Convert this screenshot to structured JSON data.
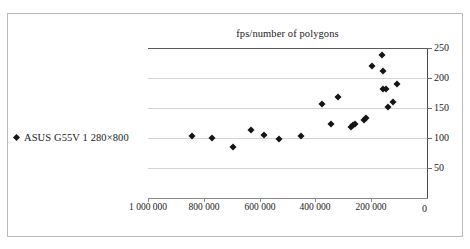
{
  "figure": {
    "background_color": "#ffffff",
    "frame_color": "#b9b9b9",
    "marker_color": "#151515",
    "gridline_color": "#d4d4d4",
    "axis_color": "#4a4a4a"
  },
  "legend": {
    "marker_icon": "diamond-marker-icon",
    "label": "ASUS G55V 1 280×800"
  },
  "chart_data": {
    "type": "scatter",
    "title": "fps/number of polygons",
    "xlabel": "",
    "ylabel": "",
    "xlim": [
      1000000,
      0
    ],
    "ylim": [
      0,
      250
    ],
    "x_reversed": true,
    "grid": true,
    "legend_position": "left",
    "xticks": [
      1000000,
      800000,
      600000,
      400000,
      200000,
      0
    ],
    "xticklabels": [
      "1 000 000",
      "800 000",
      "600 000",
      "400 000",
      "200 000",
      "0"
    ],
    "yticks": [
      0,
      50,
      100,
      150,
      200,
      250
    ],
    "yticklabels": [
      "0",
      "50",
      "100",
      "150",
      "200",
      "250"
    ],
    "series": [
      {
        "name": "ASUS G55V 1 280×800",
        "marker": "diamond",
        "color": "#151515",
        "points": [
          {
            "x": 842000,
            "y": 103
          },
          {
            "x": 770000,
            "y": 100
          },
          {
            "x": 695000,
            "y": 85
          },
          {
            "x": 632000,
            "y": 114
          },
          {
            "x": 586000,
            "y": 105
          },
          {
            "x": 529000,
            "y": 99
          },
          {
            "x": 452000,
            "y": 103
          },
          {
            "x": 376000,
            "y": 157
          },
          {
            "x": 344000,
            "y": 124
          },
          {
            "x": 318000,
            "y": 168
          },
          {
            "x": 272000,
            "y": 118
          },
          {
            "x": 266000,
            "y": 121
          },
          {
            "x": 258000,
            "y": 123
          },
          {
            "x": 226000,
            "y": 130
          },
          {
            "x": 218000,
            "y": 134
          },
          {
            "x": 196000,
            "y": 220
          },
          {
            "x": 162000,
            "y": 238
          },
          {
            "x": 158000,
            "y": 211
          },
          {
            "x": 156000,
            "y": 182
          },
          {
            "x": 146000,
            "y": 181
          },
          {
            "x": 140000,
            "y": 151
          },
          {
            "x": 122000,
            "y": 160
          },
          {
            "x": 108000,
            "y": 190
          }
        ]
      }
    ]
  }
}
